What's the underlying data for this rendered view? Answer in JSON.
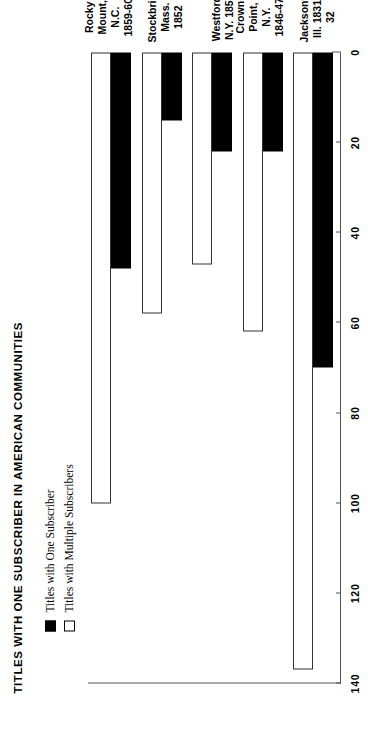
{
  "chart": {
    "title": "TITLES WITH ONE SUBSCRIBER IN AMERICAN COMMUNITIES",
    "legend": [
      {
        "label": "Titles with One Subscriber",
        "swatch": "black-filled-square",
        "color": "#000000"
      },
      {
        "label": "Titles with Multiple Subscribers",
        "swatch": "white-hollow-square",
        "color": "#ffffff"
      }
    ],
    "ticks": [
      "140",
      "120",
      "100",
      "80",
      "60",
      "40",
      "20",
      "0"
    ]
  },
  "chart_data": {
    "type": "bar",
    "orientation": "horizontal-rotated",
    "title": "TITLES WITH ONE SUBSCRIBER IN AMERICAN COMMUNITIES",
    "xlabel": "",
    "ylabel": "",
    "xlim": [
      0,
      140
    ],
    "grid": false,
    "legend_position": "upper-left",
    "categories": [
      "Jacksonville,\nIll. 1831-32",
      "Crown\nPoint, N.Y.\n1846-47",
      "Westford,\nN.Y. 1850",
      "Stockbridge,\nMass. 1852",
      "Rocky\nMount, N.C.\n1859-60"
    ],
    "tick_values": [
      140,
      120,
      100,
      80,
      60,
      40,
      20,
      0
    ],
    "series": [
      {
        "name": "Titles with Multiple Subscribers",
        "color": "#ffffff",
        "values": [
          137,
          62,
          47,
          58,
          100
        ]
      },
      {
        "name": "Titles with One Subscriber",
        "color": "#000000",
        "values": [
          70,
          22,
          22,
          15,
          48
        ]
      }
    ]
  }
}
